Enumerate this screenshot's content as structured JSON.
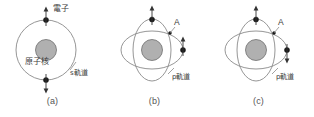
{
  "figure": {
    "panel_count": 3
  },
  "colors": {
    "orbit_stroke": "#8a8a8a",
    "nucleus_fill": "#b0b0b0",
    "nucleus_stroke": "#6e6e6e",
    "electron_fill": "#1a1a1a",
    "spin_arrow": "#333333",
    "text": "#3a3a3a",
    "caption": "#555555",
    "background": "#ffffff"
  },
  "panels": [
    {
      "id": "a",
      "caption": "(a)",
      "orbital_type": "s",
      "labels": {
        "electron": "電子",
        "nucleus": "原子核",
        "orbital": "s軌道"
      },
      "electrons": [
        {
          "position": "top",
          "spin": "up"
        },
        {
          "position": "bottom",
          "spin": "down"
        }
      ],
      "orbit_count": 1
    },
    {
      "id": "b",
      "caption": "(b)",
      "orbital_type": "p",
      "labels": {
        "point": "A",
        "orbital": "p軌道"
      },
      "electrons": [
        {
          "position": "top",
          "spin": "up"
        },
        {
          "position": "right",
          "spin": "up"
        }
      ],
      "orbit_count": 2
    },
    {
      "id": "c",
      "caption": "(c)",
      "orbital_type": "p",
      "labels": {
        "point": "A",
        "orbital": "p軌道"
      },
      "electrons": [
        {
          "position": "top",
          "spin": "up"
        },
        {
          "position": "right",
          "spin": "down"
        }
      ],
      "orbit_count": 2
    }
  ]
}
